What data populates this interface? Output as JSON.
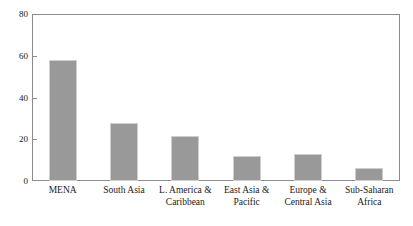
{
  "chart_data": {
    "type": "bar",
    "title": "",
    "subtitle": "",
    "xlabel": "",
    "ylabel": "",
    "categories": [
      "MENA",
      "South Asia",
      "L. America &\nCaribbean",
      "East Asia &\nPacific",
      "Europe &\nCentral Asia",
      "Sub-Saharan\nAfrica"
    ],
    "values": [
      58,
      28,
      21.5,
      12,
      13,
      6
    ],
    "ylim": [
      0,
      80
    ],
    "yticks": [
      0,
      20,
      40,
      60,
      80
    ],
    "ytick_labels": [
      "0",
      "20",
      "40",
      "60",
      "80"
    ],
    "grid": false,
    "legend": null,
    "bar_color": "#999999",
    "bar_edge_color": "#cfcfcf",
    "axis_color": "#8c8c8c",
    "background_color": "#ffffff"
  }
}
